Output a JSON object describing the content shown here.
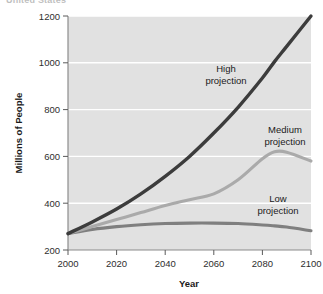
{
  "figure": {
    "clipped_caption": "United States",
    "background": "#ffffff"
  },
  "chart_data": {
    "type": "line",
    "title": "",
    "xlabel": "Year",
    "ylabel": "Millions of People",
    "xlim": [
      2000,
      2100
    ],
    "ylim": [
      200,
      1200
    ],
    "xticks": [
      2000,
      2020,
      2040,
      2060,
      2080,
      2100
    ],
    "yticks": [
      200,
      400,
      600,
      800,
      1000,
      1200
    ],
    "xtick_labels": [
      "2000",
      "2020",
      "2040",
      "2060",
      "2080",
      "2100"
    ],
    "ytick_labels": [
      "200",
      "400",
      "600",
      "800",
      "1000",
      "1200"
    ],
    "grid": "horizontal-white",
    "plot_background": "#e1e1e1",
    "legend": "none-inline-annotations",
    "x": [
      2000,
      2010,
      2020,
      2030,
      2040,
      2050,
      2060,
      2070,
      2080,
      2085,
      2090,
      2100
    ],
    "series": [
      {
        "name": "High projection",
        "color": "#3c3c3c",
        "values": [
          270,
          320,
          375,
          440,
          515,
          600,
          700,
          810,
          935,
          1005,
          1070,
          1200
        ],
        "annotation": "High\nprojection",
        "annotation_line1": "High",
        "annotation_line2": "projection"
      },
      {
        "name": "Medium projection",
        "color": "#aaaaaa",
        "values": [
          270,
          300,
          330,
          360,
          390,
          415,
          440,
          500,
          590,
          620,
          618,
          580
        ],
        "annotation": "Medium\nprojection",
        "annotation_line1": "Medium",
        "annotation_line2": "projection"
      },
      {
        "name": "Low projection",
        "color": "#7f7f7f",
        "values": [
          270,
          288,
          300,
          308,
          313,
          315,
          315,
          313,
          307,
          303,
          298,
          282
        ],
        "annotation": "Low\nprojection",
        "annotation_line1": "Low",
        "annotation_line2": "projection"
      }
    ]
  }
}
